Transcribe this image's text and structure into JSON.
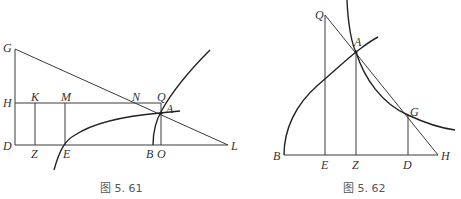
{
  "figures": [
    {
      "caption": "图 5. 61",
      "labels": {
        "G": "G",
        "H": "H",
        "D": "D",
        "K": "K",
        "M": "M",
        "N": "N",
        "Q": "Q",
        "A": "A",
        "Z": "Z",
        "E": "E",
        "B": "B",
        "O": "O",
        "L": "L"
      }
    },
    {
      "caption": "图 5. 62",
      "labels": {
        "Q": "Q",
        "A": "A",
        "G": "G",
        "B": "B",
        "E": "E",
        "Z": "Z",
        "D": "D",
        "H": "H"
      }
    }
  ]
}
